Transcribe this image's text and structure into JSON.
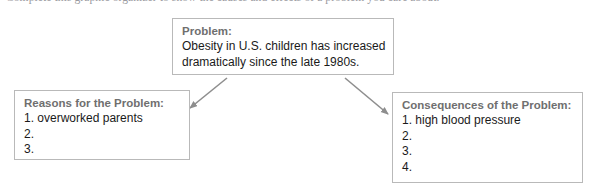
{
  "page": {
    "clipped_header_text": "Complete this graphic organizer to show the causes and effects of a problem you care about.",
    "background_color": "#ffffff"
  },
  "colors": {
    "box_border": "#b9b9b9",
    "heading_text": "#6f6f6f",
    "body_text": "#1a1a1a",
    "arrow": "#8e8e8e"
  },
  "diagram": {
    "type": "problem-reasons-consequences-organizer",
    "boxes": [
      {
        "id": "problem",
        "title": "Problem:",
        "lines": [
          "Obesity in U.S. children has increased",
          "dramatically since the late 1980s."
        ]
      },
      {
        "id": "reasons",
        "title": "Reasons for the Problem:",
        "lines": [
          "1. overworked parents",
          "2.",
          "3."
        ]
      },
      {
        "id": "consequences",
        "title": "Consequences of the Problem:",
        "lines": [
          "1. high blood pressure",
          "2.",
          "3.",
          "4."
        ]
      }
    ],
    "arrows": [
      {
        "id": "problem-to-reasons",
        "from": "problem",
        "to": "reasons",
        "direction": "down-left"
      },
      {
        "id": "problem-to-consequences",
        "from": "problem",
        "to": "consequences",
        "direction": "down-right"
      }
    ]
  }
}
